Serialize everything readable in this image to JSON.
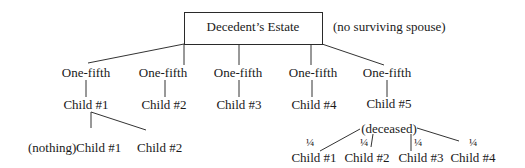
{
  "root": {
    "label": "Decedent’s Estate",
    "note": "(no surviving spouse)"
  },
  "shares": [
    "One-fifth",
    "One-fifth",
    "One-fifth",
    "One-fifth",
    "One-fifth"
  ],
  "children": [
    "Child #1",
    "Child #2",
    "Child #3",
    "Child #4",
    "Child #5"
  ],
  "child5_status": "(deceased)",
  "child1_branch": {
    "nothing_label": "(nothing)",
    "grandchildren": [
      "Child #1",
      "Child #2"
    ]
  },
  "child5_branch": {
    "fractions": [
      "¼",
      "¼",
      "¼",
      "¼"
    ],
    "grandchildren": [
      "Child #1",
      "Child #2",
      "Child #3",
      "Child #4"
    ]
  }
}
